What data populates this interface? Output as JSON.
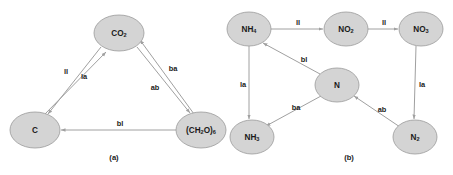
{
  "figure": {
    "background_color": "#ffffff",
    "node_fill": "#d4d4d4",
    "node_stroke": "#9a9a9a",
    "edge_color": "#a0a0a0",
    "text_color": "#1a1a1a"
  },
  "panels": [
    {
      "id": "panel-a",
      "caption": "(a)",
      "caption_x": 114,
      "caption_y": 158,
      "nodes": [
        {
          "id": "co2",
          "base": "CO",
          "sub": "2",
          "sub2": "",
          "x": 119,
          "y": 33,
          "rx": 25,
          "ry": 18
        },
        {
          "id": "c",
          "base": "C",
          "sub": "",
          "sub2": "",
          "x": 35,
          "y": 130,
          "rx": 25,
          "ry": 18
        },
        {
          "id": "ch2o6",
          "base": "(CH",
          "sub": "2",
          "sub2": "O)",
          "sub3": "6",
          "x": 201,
          "y": 130,
          "rx": 25,
          "ry": 18
        }
      ],
      "edges": [
        {
          "id": "co2-to-c-ll",
          "label": "ll",
          "label_x": 66,
          "label_y": 72,
          "x1": 101,
          "y1": 47,
          "x2": 48,
          "y2": 114
        },
        {
          "id": "c-to-co2-la",
          "label": "la",
          "label_x": 84,
          "label_y": 77,
          "x1": 44,
          "y1": 115,
          "x2": 106,
          "y2": 52
        },
        {
          "id": "co2-to-ch2o-ba",
          "label": "ba",
          "label_x": 173,
          "label_y": 69,
          "x1": 137,
          "y1": 47,
          "x2": 190,
          "y2": 113
        },
        {
          "id": "ch2o-to-co2-ab",
          "label": "ab",
          "label_x": 155,
          "label_y": 88,
          "x1": 194,
          "y1": 114,
          "x2": 140,
          "y2": 40
        },
        {
          "id": "ch2o-to-c-bl",
          "label": "bl",
          "label_x": 120,
          "label_y": 124,
          "x1": 176,
          "y1": 130,
          "x2": 61,
          "y2": 130
        }
      ]
    },
    {
      "id": "panel-b",
      "caption": "(b)",
      "caption_x": 349,
      "caption_y": 158,
      "nodes": [
        {
          "id": "nh4",
          "base": "NH",
          "sub": "4",
          "x": 249,
          "y": 29,
          "rx": 22,
          "ry": 17
        },
        {
          "id": "no2",
          "base": "NO",
          "sub": "2",
          "x": 346,
          "y": 29,
          "rx": 22,
          "ry": 17
        },
        {
          "id": "no3",
          "base": "NO",
          "sub": "3",
          "x": 421,
          "y": 29,
          "rx": 22,
          "ry": 17
        },
        {
          "id": "n",
          "base": "N",
          "sub": "",
          "x": 337,
          "y": 85,
          "rx": 22,
          "ry": 17
        },
        {
          "id": "nh3",
          "base": "NH",
          "sub": "3",
          "x": 252,
          "y": 137,
          "rx": 22,
          "ry": 17
        },
        {
          "id": "n2",
          "base": "N",
          "sub": "2",
          "x": 415,
          "y": 137,
          "rx": 22,
          "ry": 17
        }
      ],
      "edges": [
        {
          "id": "nh4-to-no2-ll",
          "label": "ll",
          "label_x": 298,
          "label_y": 23,
          "x1": 271,
          "y1": 29,
          "x2": 323,
          "y2": 29
        },
        {
          "id": "no2-to-no3-ll",
          "label": "ll",
          "label_x": 384,
          "label_y": 23,
          "x1": 368,
          "y1": 29,
          "x2": 398,
          "y2": 29
        },
        {
          "id": "n-to-nh4-bl",
          "label": "bl",
          "label_x": 304,
          "label_y": 60,
          "x1": 320,
          "y1": 74,
          "x2": 263,
          "y2": 43
        },
        {
          "id": "nh4-to-nh3-la",
          "label": "la",
          "label_x": 243,
          "label_y": 85,
          "x1": 249,
          "y1": 46,
          "x2": 249,
          "y2": 119
        },
        {
          "id": "no3-to-n2-la",
          "label": "la",
          "label_x": 422,
          "label_y": 85,
          "x1": 416,
          "y1": 46,
          "x2": 414,
          "y2": 119
        },
        {
          "id": "n-to-nh3-ba",
          "label": "ba",
          "label_x": 296,
          "label_y": 108,
          "x1": 321,
          "y1": 96,
          "x2": 266,
          "y2": 126
        },
        {
          "id": "n2-to-n-ab",
          "label": "ab",
          "label_x": 382,
          "label_y": 110,
          "x1": 400,
          "y1": 127,
          "x2": 354,
          "y2": 96
        }
      ]
    }
  ]
}
